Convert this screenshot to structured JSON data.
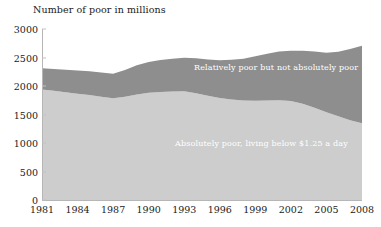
{
  "chart_data": {
    "type": "area",
    "stacked": true,
    "title": "Number of poor in millions",
    "xlabel": "",
    "ylabel": "Number of poor in millions",
    "ylim": [
      0,
      3000
    ],
    "yticks": [
      0,
      500,
      1000,
      1500,
      2000,
      2500,
      3000
    ],
    "xticks": [
      "1981",
      "1984",
      "1987",
      "1990",
      "1993",
      "1996",
      "1999",
      "2002",
      "2005",
      "2008"
    ],
    "xlim": [
      1981,
      2008
    ],
    "grid": false,
    "legend_position": "inline-annotation",
    "x": [
      1981,
      1982,
      1983,
      1984,
      1985,
      1986,
      1987,
      1988,
      1989,
      1990,
      1991,
      1992,
      1993,
      1994,
      1995,
      1996,
      1997,
      1998,
      1999,
      2000,
      2001,
      2002,
      2003,
      2004,
      2005,
      2006,
      2007,
      2008
    ],
    "series": [
      {
        "name": "Absolutely poor, living below $1.25 a day",
        "color": "#cdcdcd",
        "values": [
          1938,
          1915,
          1890,
          1865,
          1840,
          1810,
          1785,
          1810,
          1850,
          1880,
          1895,
          1905,
          1910,
          1875,
          1830,
          1790,
          1762,
          1745,
          1740,
          1745,
          1752,
          1735,
          1690,
          1620,
          1540,
          1470,
          1400,
          1345
        ]
      },
      {
        "name": "Relatively poor but not absolutely poor",
        "color": "#8e8e8e",
        "values": [
          372,
          385,
          395,
          408,
          418,
          425,
          432,
          470,
          512,
          540,
          560,
          572,
          585,
          610,
          635,
          662,
          700,
          735,
          780,
          820,
          855,
          885,
          930,
          985,
          1045,
          1130,
          1250,
          1360
        ]
      }
    ],
    "totals": [
      2310,
      2300,
      2285,
      2273,
      2258,
      2235,
      2217,
      2280,
      2362,
      2420,
      2455,
      2477,
      2495,
      2485,
      2465,
      2452,
      2462,
      2480,
      2520,
      2565,
      2607,
      2620,
      2620,
      2605,
      2585,
      2600,
      2650,
      2705
    ],
    "annotations": [
      {
        "text": "Relatively poor but not absolutely poor",
        "series": "upper"
      },
      {
        "text": "Absolutely poor, living below $1.25 a day",
        "series": "lower"
      }
    ]
  },
  "labels": {
    "axis_title": "Number of poor in millions",
    "upper_band": "Relatively poor but not absolutely poor",
    "lower_band": "Absolutely poor, living below $1.25 a day"
  },
  "colors": {
    "upper_band": "#8e8e8e",
    "lower_band": "#cdcdcd",
    "axis": "#b6b6b6",
    "text": "#1a1a1a",
    "label_text": "#ffffff",
    "background": "#ffffff"
  }
}
